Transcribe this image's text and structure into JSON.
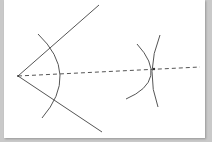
{
  "diagram": {
    "title": "",
    "type": "angle-bisector-construction",
    "colors": {
      "background": "#c9c9c9",
      "paper": "#ffffff",
      "stroke": "#555555"
    },
    "vertex": {
      "x": 18,
      "y": 76
    },
    "rays": [
      {
        "name": "upper-ray",
        "x2": 99,
        "y2": 5
      },
      {
        "name": "lower-ray",
        "x2": 102,
        "y2": 132
      }
    ],
    "bisector": {
      "style": "dashed",
      "x2": 200,
      "y2": 67
    },
    "arcs": [
      {
        "name": "vertex-arc",
        "path": "M38 34 Q 80 74 42 118"
      },
      {
        "name": "right-arc-1",
        "path": "M137 44 Q 170 80 126 99"
      },
      {
        "name": "right-arc-2",
        "path": "M160 35 Q 145 72 158 107"
      }
    ],
    "intersection": {
      "x": 154,
      "y": 69
    }
  }
}
